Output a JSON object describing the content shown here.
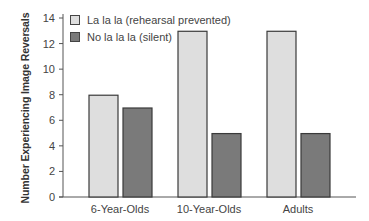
{
  "chart_data": {
    "type": "bar",
    "title": "",
    "xlabel": "",
    "ylabel": "Number Experiencing Image Reversals",
    "ylim": [
      0,
      14
    ],
    "yticks": [
      0,
      2,
      4,
      6,
      8,
      10,
      12,
      14
    ],
    "grid": false,
    "legend_position": "upper-left",
    "categories": [
      "6-Year-Olds",
      "10-Year-Olds",
      "Adults"
    ],
    "series": [
      {
        "name": "La la la (rehearsal prevented)",
        "values": [
          8,
          13,
          13
        ],
        "color": "#dedede"
      },
      {
        "name": "No la la la (silent)",
        "values": [
          7,
          5,
          5
        ],
        "color": "#7a7a7a"
      }
    ]
  },
  "colors": {
    "bar_border": "#3a3a3a",
    "axis": "#555555"
  }
}
